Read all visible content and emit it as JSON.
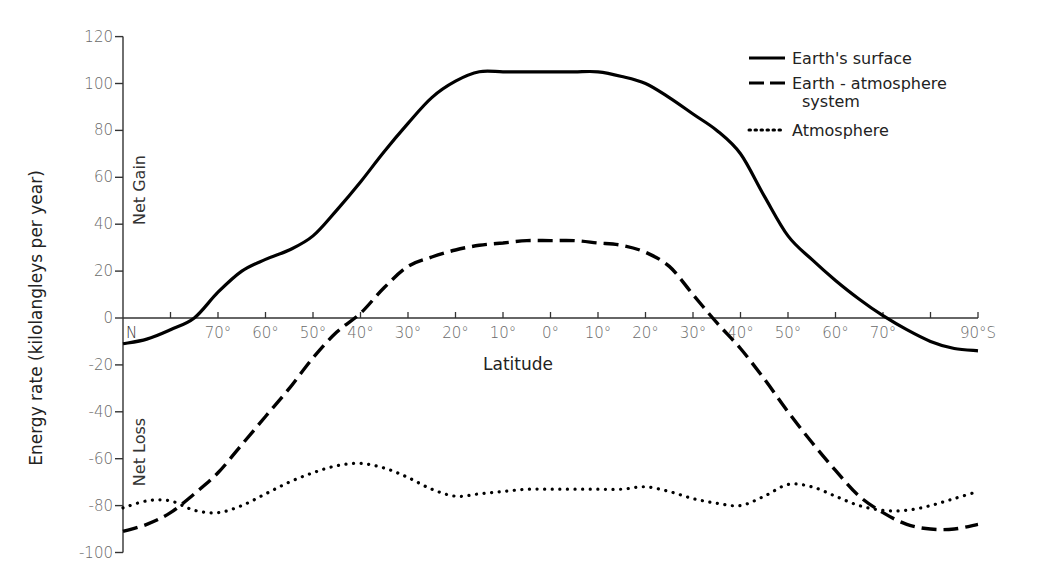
{
  "chart_data": {
    "type": "line",
    "title": "",
    "xlabel": "Latitude",
    "ylabel": "Energy rate (kilolangleys per year)",
    "ylim": [
      -100,
      120
    ],
    "yticks": [
      120,
      100,
      80,
      60,
      40,
      20,
      0,
      -20,
      -40,
      -60,
      -80,
      -100
    ],
    "ytick_labels": [
      "120",
      "100",
      "80",
      "60",
      "40",
      "20",
      "0",
      "-20",
      "-40",
      "-60",
      "-80",
      "-100"
    ],
    "x_ticks_lat": [
      80,
      70,
      60,
      50,
      40,
      30,
      20,
      10,
      0,
      -10,
      -20,
      -30,
      -40,
      -50,
      -60,
      -70,
      -80,
      -90
    ],
    "x_tick_labels": [
      {
        "lat": 90,
        "label": "N"
      },
      {
        "lat": 70,
        "label": "70°"
      },
      {
        "lat": 60,
        "label": "60°"
      },
      {
        "lat": 50,
        "label": "50°"
      },
      {
        "lat": 40,
        "label": "40°"
      },
      {
        "lat": 30,
        "label": "30°"
      },
      {
        "lat": 20,
        "label": "20°"
      },
      {
        "lat": 10,
        "label": "10°"
      },
      {
        "lat": 0,
        "label": "0°"
      },
      {
        "lat": -10,
        "label": "10°"
      },
      {
        "lat": -20,
        "label": "20°"
      },
      {
        "lat": -30,
        "label": "30°"
      },
      {
        "lat": -40,
        "label": "40°"
      },
      {
        "lat": -50,
        "label": "50°"
      },
      {
        "lat": -60,
        "label": "60°"
      },
      {
        "lat": -70,
        "label": "70°"
      },
      {
        "lat": -90,
        "label": "90°S"
      }
    ],
    "region_labels": {
      "gain": "Net Gain",
      "loss": "Net Loss"
    },
    "grid": false,
    "legend_position": "upper right",
    "x_note": "Latitude from 90°N (left) to 90°S (right); positive = N, negative = S",
    "series": [
      {
        "name": "Earth's surface",
        "style": "solid",
        "lat": [
          90,
          85,
          80,
          75,
          70,
          65,
          60,
          55,
          50,
          45,
          40,
          35,
          30,
          25,
          20,
          15,
          10,
          5,
          0,
          -5,
          -10,
          -15,
          -20,
          -25,
          -30,
          -35,
          -40,
          -45,
          -50,
          -55,
          -60,
          -65,
          -70,
          -75,
          -80,
          -85,
          -90
        ],
        "values": [
          -11,
          -9,
          -5,
          0,
          11,
          20,
          25,
          29,
          35,
          46,
          58,
          71,
          83,
          94,
          101,
          105,
          105,
          105,
          105,
          105,
          105,
          103,
          100,
          94,
          87,
          80,
          70,
          52,
          35,
          25,
          16,
          8,
          1,
          -5,
          -10,
          -13,
          -14
        ]
      },
      {
        "name": "Earth - atmosphere system",
        "style": "dashed",
        "lat": [
          90,
          85,
          80,
          75,
          70,
          65,
          60,
          55,
          50,
          45,
          40,
          35,
          30,
          25,
          20,
          15,
          10,
          5,
          0,
          -5,
          -10,
          -15,
          -20,
          -25,
          -30,
          -35,
          -40,
          -45,
          -50,
          -55,
          -60,
          -65,
          -70,
          -75,
          -80,
          -85,
          -90
        ],
        "values": [
          -91,
          -88,
          -83,
          -75,
          -66,
          -54,
          -42,
          -30,
          -17,
          -6,
          2,
          13,
          22,
          26,
          29,
          31,
          32,
          33,
          33,
          33,
          32,
          31,
          28,
          22,
          10,
          -2,
          -13,
          -26,
          -40,
          -53,
          -65,
          -76,
          -83,
          -88,
          -90,
          -90,
          -88
        ]
      },
      {
        "name": "Atmosphere",
        "style": "dotted",
        "lat": [
          90,
          85,
          80,
          75,
          70,
          65,
          60,
          55,
          50,
          45,
          40,
          35,
          30,
          25,
          20,
          15,
          10,
          5,
          0,
          -5,
          -10,
          -15,
          -20,
          -25,
          -30,
          -35,
          -40,
          -45,
          -50,
          -55,
          -60,
          -65,
          -70,
          -75,
          -80,
          -85,
          -90
        ],
        "values": [
          -81,
          -78,
          -78,
          -82,
          -83,
          -80,
          -75,
          -70,
          -66,
          -63,
          -62,
          -64,
          -68,
          -73,
          -76,
          -75,
          -74,
          -73,
          -73,
          -73,
          -73,
          -73,
          -72,
          -74,
          -77,
          -79,
          -80,
          -76,
          -71,
          -72,
          -76,
          -80,
          -82,
          -82,
          -80,
          -77,
          -74
        ]
      }
    ],
    "legend": [
      {
        "label": "Earth's surface",
        "style": "solid"
      },
      {
        "label": "Earth - atmosphere",
        "label_line2": "system",
        "style": "dashed"
      },
      {
        "label": "Atmosphere",
        "style": "dotted"
      }
    ]
  }
}
